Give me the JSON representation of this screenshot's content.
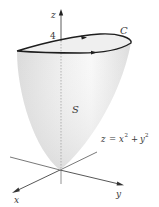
{
  "figure": {
    "type": "3d-surface-diagram",
    "surface_label": "S",
    "curve_label": "C",
    "equation": {
      "lhs": "z",
      "rhs_x_base": "x",
      "rhs_exp": "2",
      "plus": "+",
      "rhs_y_base": "y",
      "equals": "="
    },
    "equation_text": "z = x² + y²",
    "z_height_label": "4",
    "axes": {
      "x": "x",
      "y": "y",
      "z": "z"
    },
    "colors": {
      "surface_fill": "#e6e6e6",
      "surface_highlight": "#f7f7f7",
      "curve": "#1e1e1e",
      "axes": "#555555",
      "text": "#3a3a3a"
    }
  }
}
